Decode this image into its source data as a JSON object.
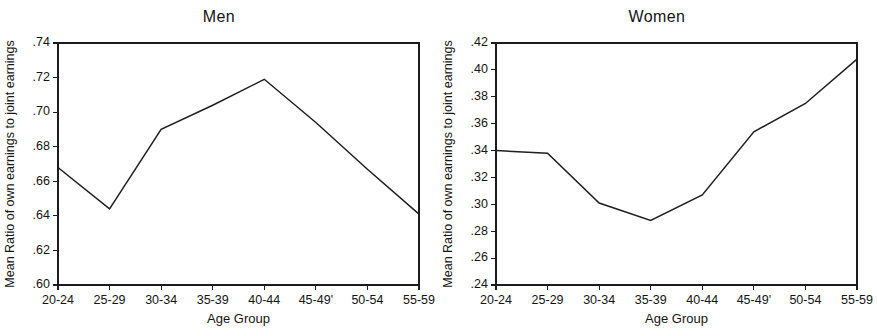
{
  "figure": {
    "background_color": "#ffffff",
    "line_color": "#1f1f1f",
    "axis_color": "#1c1c1c",
    "panel_count": 2
  },
  "chart_data": [
    {
      "type": "line",
      "title": "Men",
      "xlabel": "Age Group",
      "ylabel": "Mean Ratio of own earnings to joint earnings",
      "categories": [
        "20-24",
        "25-29",
        "30-34",
        "35-39",
        "40-44",
        "45-49'",
        "50-54",
        "55-59"
      ],
      "values": [
        0.668,
        0.644,
        0.69,
        0.704,
        0.719,
        0.694,
        0.667,
        0.641
      ],
      "ylim": [
        0.6,
        0.74
      ],
      "ytick_values": [
        0.6,
        0.62,
        0.64,
        0.66,
        0.68,
        0.7,
        0.72,
        0.74
      ],
      "ytick_labels": [
        ".60",
        ".62",
        ".64",
        ".66",
        ".68",
        ".70",
        ".72",
        ".74"
      ],
      "grid": false,
      "legend": false
    },
    {
      "type": "line",
      "title": "Women",
      "xlabel": "Age Group",
      "ylabel": "Mean Ratio of own earnings to joint earnings",
      "categories": [
        "20-24",
        "25-29",
        "30-34",
        "35-39",
        "40-44",
        "45-49'",
        "50-54",
        "55-59"
      ],
      "values": [
        0.34,
        0.338,
        0.301,
        0.288,
        0.307,
        0.354,
        0.375,
        0.408
      ],
      "ylim": [
        0.24,
        0.42
      ],
      "ytick_values": [
        0.24,
        0.26,
        0.28,
        0.3,
        0.32,
        0.34,
        0.36,
        0.38,
        0.4,
        0.42
      ],
      "ytick_labels": [
        ".24",
        ".26",
        ".28",
        ".30",
        ".32",
        ".34",
        ".36",
        ".38",
        ".40",
        ".42"
      ],
      "grid": false,
      "legend": false
    }
  ]
}
